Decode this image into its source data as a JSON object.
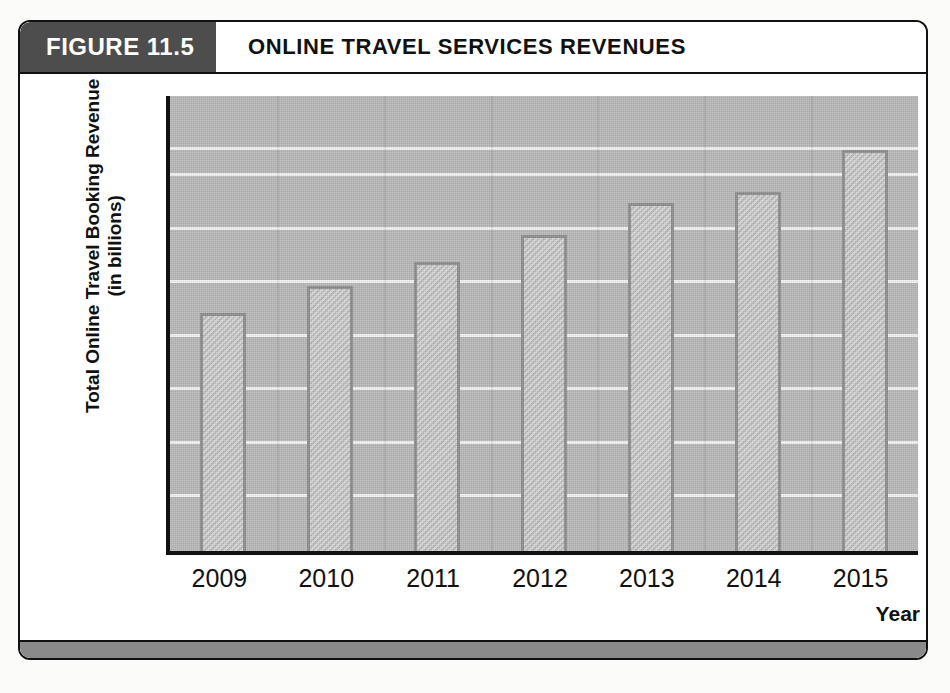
{
  "figure": {
    "tab_label": "FIGURE 11.5",
    "title": "ONLINE TRAVEL SERVICES REVENUES"
  },
  "chart_data": {
    "type": "bar",
    "title": "ONLINE TRAVEL SERVICES REVENUES",
    "categories": [
      "2009",
      "2010",
      "2011",
      "2012",
      "2013",
      "2014",
      "2015"
    ],
    "values": [
      89,
      99,
      108,
      118,
      130,
      134,
      150
    ],
    "xlabel": "Year",
    "ylabel": "Total Online Travel Booking Revenue (in billions)",
    "ylabel_line1": "Total Online Travel Booking Revenue",
    "ylabel_line2": "(in billions)",
    "yticks": [
      0,
      20,
      40,
      60,
      80,
      100,
      120,
      140,
      150
    ],
    "ytick_labels": [
      "0",
      "20",
      "40",
      "60",
      "80",
      "100",
      "120",
      "140",
      "150"
    ],
    "ylim": [
      0,
      150
    ],
    "grid": true,
    "legend": "none",
    "units": "billions of U.S. dollars",
    "colors": {
      "plot_background": "#b9b9b9",
      "bar_fill": "#c6c6c6",
      "bar_border": "#8e8e8e",
      "gridline": "#f2f2f2",
      "axis": "#111111",
      "tab_background": "#4d4d4d",
      "tab_text": "#ffffff"
    }
  }
}
